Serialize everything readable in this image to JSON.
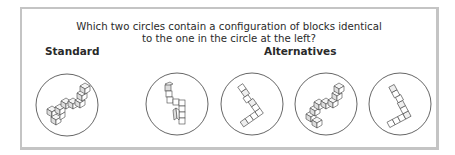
{
  "question": {
    "line1": "Which two circles contain a configuration of blocks identical",
    "line2": "to the one in the circle at the left?"
  },
  "labels": {
    "standard": "Standard",
    "alternatives": "Alternatives"
  },
  "circles": [
    {
      "id": "standard",
      "role": "standard"
    },
    {
      "id": "alternative-1",
      "role": "alternative"
    },
    {
      "id": "alternative-2",
      "role": "alternative"
    },
    {
      "id": "alternative-3",
      "role": "alternative"
    },
    {
      "id": "alternative-4",
      "role": "alternative"
    }
  ],
  "colors": {
    "frame_border": "#c4c4c4",
    "circle_stroke": "#555555",
    "cube_stroke": "#444444",
    "cube_face_top": "#f2f2f2",
    "cube_face_side": "#dddddd",
    "cube_face_front": "#ffffff"
  }
}
